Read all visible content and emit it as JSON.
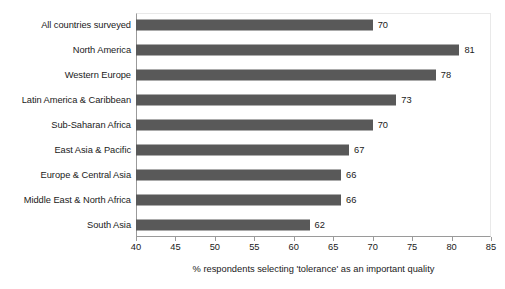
{
  "chart_data": {
    "type": "bar",
    "orientation": "horizontal",
    "title": "",
    "xlabel": "% respondents selecting 'tolerance' as an important quality",
    "ylabel": "",
    "xlim": [
      40,
      85
    ],
    "xticks": [
      40,
      45,
      50,
      55,
      60,
      65,
      70,
      75,
      80,
      85
    ],
    "grid": false,
    "legend": false,
    "bar_color": "#595959",
    "categories": [
      "All countries surveyed",
      "North America",
      "Western Europe",
      "Latin America & Caribbean",
      "Sub-Saharan Africa",
      "East Asia & Pacific",
      "Europe & Central Asia",
      "Middle East & North Africa",
      "South Asia"
    ],
    "values": [
      70,
      81,
      78,
      73,
      70,
      67,
      66,
      66,
      62
    ],
    "value_labels": [
      "70",
      "81",
      "78",
      "73",
      "70",
      "67",
      "66",
      "66",
      "62"
    ]
  }
}
